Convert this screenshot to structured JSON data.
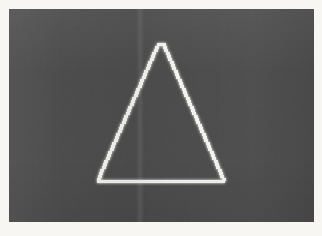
{
  "image": {
    "kind": "photograph-of-display",
    "width": 322,
    "height": 236,
    "caption": "",
    "bezel_color": "#f7f6f3",
    "screen": {
      "x": 9,
      "y": 9,
      "width": 305,
      "height": 213,
      "background_color": "#4a4a4a",
      "seam_x": 140,
      "seam_label": "vertical-scan-band"
    }
  },
  "figure": {
    "name": "aliased-triangle-outline",
    "stroke_color": "#f2f2ef",
    "stroke_width_px": 3,
    "rendering": "staircase-aliased",
    "vertices": {
      "apex": {
        "x": 163,
        "y": 44,
        "label": "apex"
      },
      "bottom_left": {
        "x": 97,
        "y": 181,
        "label": "bottom-left"
      },
      "bottom_right": {
        "x": 234,
        "y": 181,
        "label": "bottom-right"
      }
    },
    "measurements": {
      "base_length_px": 137,
      "height_px": 137,
      "apex_offset_from_base_center_px": 2
    },
    "edges": [
      {
        "name": "left-edge",
        "from": "bottom_left",
        "to": "apex",
        "aliased": true
      },
      {
        "name": "right-edge",
        "from": "apex",
        "to": "bottom_right",
        "aliased": true
      },
      {
        "name": "base-edge",
        "from": "bottom_left",
        "to": "bottom_right",
        "aliased": false
      }
    ],
    "step_pattern": {
      "left_edge_step_x_px": 2,
      "left_edge_step_y_px": 3,
      "right_edge_step_x_px": 2,
      "right_edge_step_y_px": 3
    }
  },
  "colors": {
    "screen_gray": "#4a4a4a",
    "stroke_white": "#f2f2ef",
    "bezel_white": "#f7f6f3",
    "stroke_bloom": "#ffffff"
  }
}
